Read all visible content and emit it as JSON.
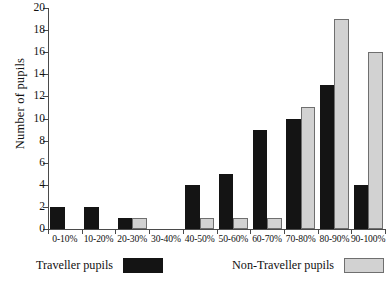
{
  "chart_data": {
    "type": "bar",
    "title": "",
    "xlabel": "",
    "ylabel": "Number of pupils",
    "ylim": [
      0,
      20
    ],
    "yticks": [
      0,
      2,
      4,
      6,
      8,
      10,
      12,
      14,
      16,
      18,
      20
    ],
    "grid": false,
    "legend_position": "bottom",
    "categories": [
      "0-10%",
      "10-20%",
      "20-30%",
      "30-40%",
      "40-50%",
      "50-60%",
      "60-70%",
      "70-80%",
      "80-90%",
      "90-100%"
    ],
    "series": [
      {
        "name": "Traveller pupils",
        "color": "#141414",
        "values": [
          2,
          2,
          1,
          0,
          4,
          5,
          9,
          10,
          13,
          4
        ]
      },
      {
        "name": "Non-Traveller pupils",
        "color": "#d2d2d2",
        "values": [
          0,
          0,
          1,
          0,
          1,
          1,
          1,
          11,
          19,
          16
        ]
      }
    ]
  },
  "axes": {
    "y_title": "Number of pupils",
    "y_tick_labels": [
      "0",
      "2",
      "4",
      "6",
      "8",
      "10",
      "12",
      "14",
      "16",
      "18",
      "20"
    ],
    "x_tick_labels": [
      "0-10%",
      "10-20%",
      "20-30%",
      "30-40%",
      "40-50%",
      "50-60%",
      "60-70%",
      "70-80%",
      "80-90%",
      "90-100%"
    ]
  },
  "legend": {
    "entries": [
      {
        "label": "Traveller pupils",
        "swatch": "black-swatch"
      },
      {
        "label": "Non-Traveller pupils",
        "swatch": "gray-swatch"
      }
    ]
  },
  "colors": {
    "traveller": "#141414",
    "non_traveller": "#d2d2d2",
    "axis": "#4a4a4a",
    "background": "#ffffff"
  }
}
